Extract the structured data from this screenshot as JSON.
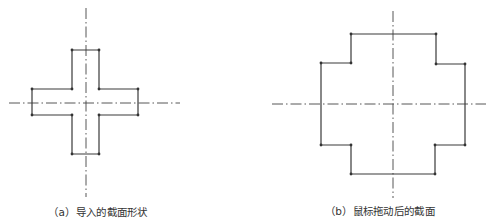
{
  "figures": [
    {
      "id": "a",
      "caption": "（a）导入的截面形状",
      "caption_pos": [
        98,
        211
      ],
      "shape": "cross",
      "outline": [
        [
          72,
          50
        ],
        [
          99,
          50
        ],
        [
          99,
          89
        ],
        [
          138,
          89
        ],
        [
          138,
          115
        ],
        [
          99,
          115
        ],
        [
          99,
          154
        ],
        [
          72,
          154
        ],
        [
          72,
          115
        ],
        [
          32,
          115
        ],
        [
          32,
          89
        ],
        [
          72,
          89
        ]
      ],
      "centerlines": {
        "horizontal": {
          "y": 103,
          "x1": 9,
          "x2": 180
        },
        "vertical": {
          "x": 86,
          "y1": 8,
          "y2": 197
        }
      }
    },
    {
      "id": "b",
      "caption": "（b）鼠标拖动后的截面",
      "caption_pos": [
        380,
        210
      ],
      "shape": "stepped-cross",
      "outline": [
        [
          351,
          34
        ],
        [
          436,
          34
        ],
        [
          436,
          64
        ],
        [
          465,
          64
        ],
        [
          465,
          145
        ],
        [
          435,
          145
        ],
        [
          435,
          174
        ],
        [
          351,
          174
        ],
        [
          351,
          145
        ],
        [
          321,
          145
        ],
        [
          321,
          63
        ],
        [
          351,
          63
        ]
      ],
      "centerlines": {
        "horizontal": {
          "y": 104,
          "x1": 272,
          "x2": 486
        },
        "vertical": {
          "x": 393,
          "y1": 11,
          "y2": 198
        }
      }
    }
  ],
  "colors": {
    "outline": "#3a3a3a",
    "centerline": "#444444",
    "background": "#ffffff"
  }
}
